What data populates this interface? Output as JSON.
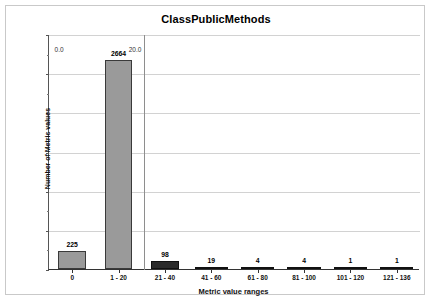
{
  "chart_data": {
    "type": "bar",
    "title": "ClassPublicMethods",
    "xlabel": "Metric value ranges",
    "ylabel": "Number of Metric values",
    "categories": [
      "0",
      "1 - 20",
      "21 - 40",
      "41 - 60",
      "61 - 80",
      "81 - 100",
      "101 - 120",
      "121 - 136"
    ],
    "values": [
      225,
      2664,
      98,
      19,
      4,
      4,
      1,
      1
    ],
    "value_labels": [
      "225",
      "2664",
      "98",
      "19",
      "4",
      "4",
      "1",
      "1"
    ],
    "ylim": [
      0,
      3000
    ],
    "yticks": [
      0,
      500,
      1000,
      1500,
      2000,
      2500,
      3000
    ],
    "ytick_labels": [
      "0",
      "500",
      "1,000",
      "1,500",
      "2,000",
      "2,500",
      "3,000"
    ],
    "grid": true,
    "legend": null,
    "annotations": [
      {
        "text": "0.0",
        "x_frac": 0.015,
        "y_frac": 0.045
      },
      {
        "text": "20.0",
        "x_frac": 0.215,
        "y_frac": 0.045
      }
    ],
    "bar_colors": [
      "#9a9a9a",
      "#9a9a9a",
      "#2b2b2b",
      "#1d1d1d",
      "#1d1d1d",
      "#1d1d1d",
      "#1d1d1d",
      "#1d1d1d"
    ],
    "marker_line_x_frac": 0.256
  }
}
